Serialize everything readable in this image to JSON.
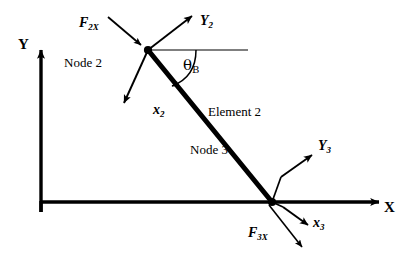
{
  "figure": {
    "background_color": "#ffffff",
    "ink_color": "#000000",
    "global_axes": {
      "y_label": "Y",
      "x_label": "X",
      "origin": [
        41,
        212
      ],
      "y_tip": [
        41,
        45
      ],
      "x_tip": [
        385,
        202
      ]
    },
    "element": {
      "label": "Element 2",
      "start_node": [
        148,
        50
      ],
      "end_node": [
        272,
        202
      ],
      "stroke_width": 5
    },
    "nodes": [
      {
        "id": "node-2",
        "label": "Node 2",
        "position": [
          148,
          50
        ],
        "local_axes": [
          {
            "name": "y2",
            "label": "Y",
            "sub": "2",
            "direction": "up-right"
          },
          {
            "name": "x2",
            "label": "x",
            "sub": "2",
            "direction": "down-left"
          }
        ],
        "force": {
          "name": "F2X",
          "label": "F",
          "sub": "2X",
          "direction": "down-right"
        },
        "angle": {
          "label": "θ",
          "sub": "B",
          "reference": "horizontal"
        }
      },
      {
        "id": "node-3",
        "label": "Node 3",
        "position": [
          272,
          202
        ],
        "local_axes": [
          {
            "name": "y3",
            "label": "Y",
            "sub": "3",
            "direction": "up-right"
          },
          {
            "name": "x3",
            "label": "x",
            "sub": "3",
            "direction": "down-right"
          }
        ],
        "force": {
          "name": "F3X",
          "label": "F",
          "sub": "3X",
          "direction": "down-right"
        }
      }
    ]
  },
  "labels": {
    "global_y": "Y",
    "global_x": "X",
    "node2": "Node 2",
    "node3": "Node 3",
    "element2": "Element 2",
    "f2x_base": "F",
    "f2x_sub": "2X",
    "f3x_base": "F",
    "f3x_sub": "3X",
    "y2_base": "Y",
    "y2_sub": "2",
    "x2_base": "x",
    "x2_sub": "2",
    "y3_base": "Y",
    "y3_sub": "3",
    "x3_base": "x",
    "x3_sub": "3",
    "theta_base": "θ",
    "theta_sub": "B"
  }
}
